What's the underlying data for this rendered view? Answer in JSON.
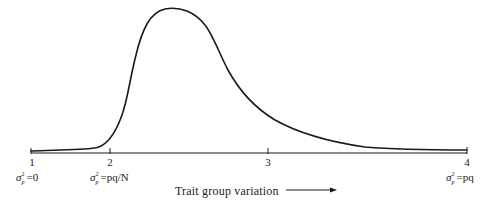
{
  "diagram": {
    "axis_label": "Trait group variation",
    "axis_arrow": "right-arrow",
    "ticks": [
      {
        "label": "1",
        "annotation_sigma": "σ",
        "annotation_sup": "2",
        "annotation_sub": "p",
        "annotation_rest": "=0"
      },
      {
        "label": "2",
        "annotation_sigma": "σ",
        "annotation_sup": "2",
        "annotation_sub": "p",
        "annotation_rest": "=pq/N"
      },
      {
        "label": "3"
      },
      {
        "label": "4",
        "annotation_sigma": "σ",
        "annotation_sup": "2",
        "annotation_sub": "p",
        "annotation_rest": "=pq"
      }
    ],
    "curve": {
      "description": "Unimodal right-skewed curve rising sharply after tick 2, peaking between ticks 2 and 3, and decaying asymptotically toward tick 4",
      "stroke_color": "#1a1a1a"
    },
    "axis_color": "#1a1a1a"
  }
}
